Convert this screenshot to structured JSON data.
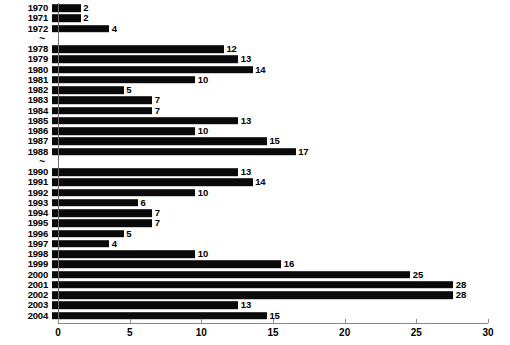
{
  "chart_data": {
    "type": "bar",
    "orientation": "horizontal",
    "title": "",
    "subtitle": "",
    "xlabel": "",
    "ylabel": "",
    "xlim": [
      0,
      30
    ],
    "ylim": null,
    "grid": false,
    "legend": null,
    "legend_position": "none",
    "bar_color": "#0a0a0a",
    "axis_color": "#8a8a8a",
    "background": "#ffffff",
    "xticks": [
      0,
      5,
      10,
      15,
      20,
      25,
      30
    ],
    "xtick_labels": [
      "0",
      "5",
      "10",
      "15",
      "20",
      "25",
      "30"
    ],
    "categories": [
      "1970",
      "1971",
      "1972",
      "1978",
      "1979",
      "1980",
      "1981",
      "1982",
      "1983",
      "1984",
      "1985",
      "1986",
      "1987",
      "1988",
      "1990",
      "1991",
      "1992",
      "1993",
      "1994",
      "1995",
      "1996",
      "1997",
      "1998",
      "1999",
      "2000",
      "2001",
      "2002",
      "2003",
      "2004"
    ],
    "values": [
      2,
      2,
      4,
      12,
      13,
      14,
      10,
      5,
      7,
      7,
      13,
      10,
      15,
      17,
      13,
      14,
      10,
      6,
      7,
      7,
      5,
      4,
      10,
      16,
      25,
      28,
      28,
      13,
      15
    ],
    "axis_break_marker": "~",
    "axis_breaks_after": [
      "1972",
      "1988"
    ],
    "rows": [
      {
        "kind": "bar",
        "year": "1970",
        "value": 2,
        "label": "2"
      },
      {
        "kind": "bar",
        "year": "1971",
        "value": 2,
        "label": "2"
      },
      {
        "kind": "bar",
        "year": "1972",
        "value": 4,
        "label": "4"
      },
      {
        "kind": "break",
        "year": "~",
        "value": null,
        "label": ""
      },
      {
        "kind": "bar",
        "year": "1978",
        "value": 12,
        "label": "12"
      },
      {
        "kind": "bar",
        "year": "1979",
        "value": 13,
        "label": "13"
      },
      {
        "kind": "bar",
        "year": "1980",
        "value": 14,
        "label": "14"
      },
      {
        "kind": "bar",
        "year": "1981",
        "value": 10,
        "label": "10"
      },
      {
        "kind": "bar",
        "year": "1982",
        "value": 5,
        "label": "5"
      },
      {
        "kind": "bar",
        "year": "1983",
        "value": 7,
        "label": "7"
      },
      {
        "kind": "bar",
        "year": "1984",
        "value": 7,
        "label": "7"
      },
      {
        "kind": "bar",
        "year": "1985",
        "value": 13,
        "label": "13"
      },
      {
        "kind": "bar",
        "year": "1986",
        "value": 10,
        "label": "10"
      },
      {
        "kind": "bar",
        "year": "1987",
        "value": 15,
        "label": "15"
      },
      {
        "kind": "bar",
        "year": "1988",
        "value": 17,
        "label": "17"
      },
      {
        "kind": "break",
        "year": "~",
        "value": null,
        "label": ""
      },
      {
        "kind": "bar",
        "year": "1990",
        "value": 13,
        "label": "13"
      },
      {
        "kind": "bar",
        "year": "1991",
        "value": 14,
        "label": "14"
      },
      {
        "kind": "bar",
        "year": "1992",
        "value": 10,
        "label": "10"
      },
      {
        "kind": "bar",
        "year": "1993",
        "value": 6,
        "label": "6"
      },
      {
        "kind": "bar",
        "year": "1994",
        "value": 7,
        "label": "7"
      },
      {
        "kind": "bar",
        "year": "1995",
        "value": 7,
        "label": "7"
      },
      {
        "kind": "bar",
        "year": "1996",
        "value": 5,
        "label": "5"
      },
      {
        "kind": "bar",
        "year": "1997",
        "value": 4,
        "label": "4"
      },
      {
        "kind": "bar",
        "year": "1998",
        "value": 10,
        "label": "10"
      },
      {
        "kind": "bar",
        "year": "1999",
        "value": 16,
        "label": "16"
      },
      {
        "kind": "bar",
        "year": "2000",
        "value": 25,
        "label": "25"
      },
      {
        "kind": "bar",
        "year": "2001",
        "value": 28,
        "label": "28"
      },
      {
        "kind": "bar",
        "year": "2002",
        "value": 28,
        "label": "28"
      },
      {
        "kind": "bar",
        "year": "2003",
        "value": 13,
        "label": "13"
      },
      {
        "kind": "bar",
        "year": "2004",
        "value": 15,
        "label": "15"
      }
    ]
  }
}
